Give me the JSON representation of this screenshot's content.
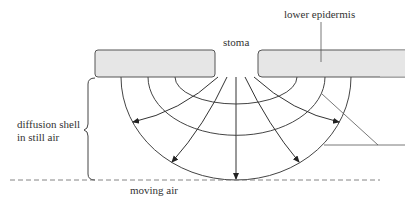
{
  "labels": {
    "stoma": "stoma",
    "lower_epidermis": "lower epidermis",
    "diffusion_shell_line1": "diffusion shell",
    "diffusion_shell_line2": "in still air",
    "moving_air": "moving air"
  },
  "colors": {
    "line": "#444444",
    "epidermis_fill": "#e6e6e6",
    "dashed": "#777777"
  }
}
